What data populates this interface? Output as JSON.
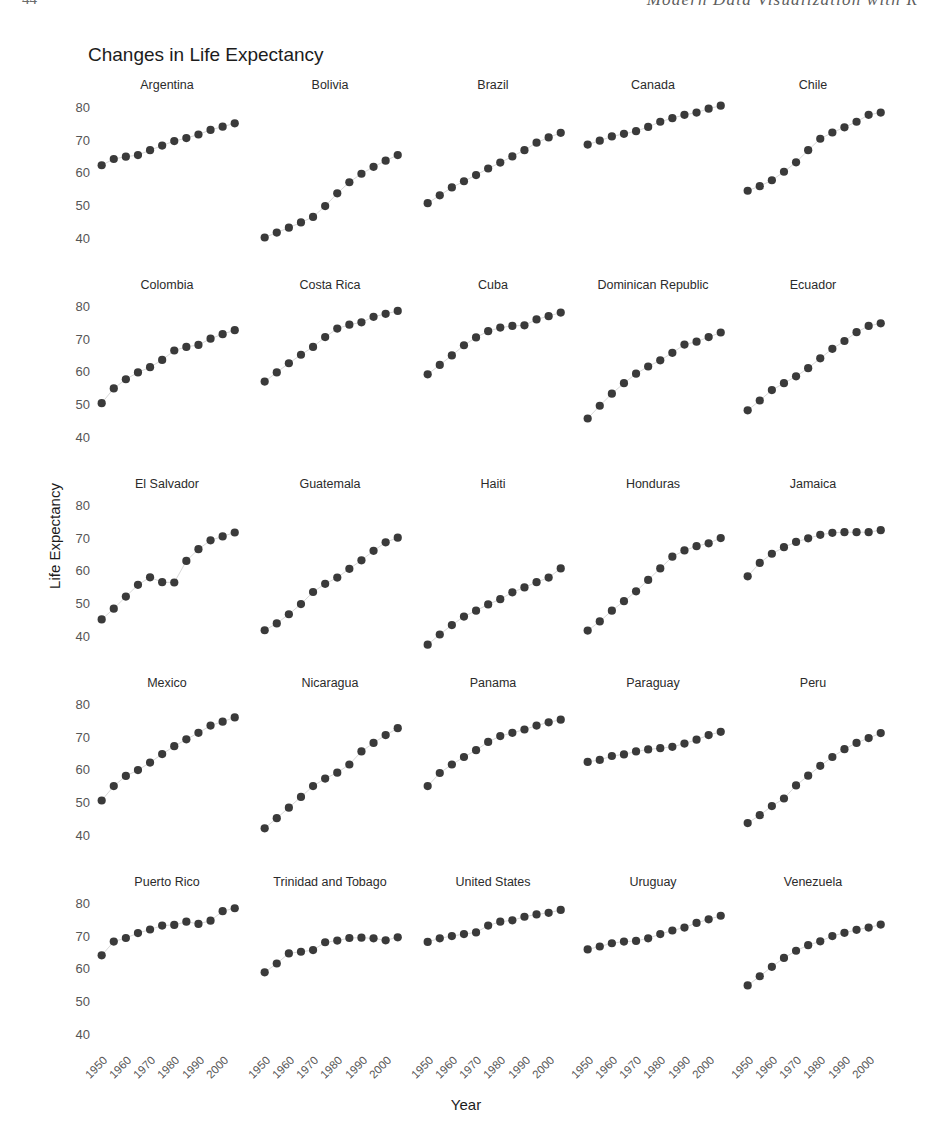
{
  "page_header": {
    "folio": "44",
    "running_title": "Modern Data Visualization with R"
  },
  "figure": {
    "title": "Changes in Life Expectancy",
    "x_axis_title": "Year",
    "y_axis_title": "Life Expectancy"
  },
  "chart_data": {
    "type": "scatter",
    "title": "Changes in Life Expectancy",
    "xlabel": "Year",
    "ylabel": "Life Expectancy",
    "xlim": [
      1948,
      2010
    ],
    "ylim": [
      36,
      84
    ],
    "xticks": [
      "1950",
      "1960",
      "1970",
      "1980",
      "1990",
      "2000"
    ],
    "xtick_values": [
      1950,
      1960,
      1970,
      1980,
      1990,
      2000
    ],
    "yticks": [
      "40",
      "50",
      "60",
      "70",
      "80"
    ],
    "ytick_values": [
      40,
      50,
      60,
      70,
      80
    ],
    "grid": false,
    "legend": "none",
    "facet_rows": 5,
    "facet_cols": 5,
    "x": [
      1952,
      1957,
      1962,
      1967,
      1972,
      1977,
      1982,
      1987,
      1992,
      1997,
      2002,
      2007
    ],
    "panels": [
      {
        "name": "Argentina",
        "values": [
          62.5,
          64.4,
          65.1,
          65.6,
          67.1,
          68.5,
          69.9,
          70.8,
          71.9,
          73.3,
          74.3,
          75.3
        ]
      },
      {
        "name": "Bolivia",
        "values": [
          40.4,
          41.9,
          43.4,
          45.0,
          46.7,
          50.0,
          53.9,
          57.3,
          59.9,
          62.0,
          63.9,
          65.6
        ]
      },
      {
        "name": "Brazil",
        "values": [
          50.9,
          53.3,
          55.7,
          57.6,
          59.5,
          61.5,
          63.3,
          65.2,
          67.1,
          69.4,
          71.0,
          72.4
        ]
      },
      {
        "name": "Canada",
        "values": [
          68.8,
          70.0,
          71.3,
          72.1,
          72.9,
          74.2,
          75.8,
          76.9,
          77.9,
          78.6,
          79.8,
          80.7
        ]
      },
      {
        "name": "Chile",
        "values": [
          54.7,
          56.1,
          57.9,
          60.5,
          63.4,
          67.1,
          70.6,
          72.5,
          74.1,
          75.8,
          77.9,
          78.6
        ]
      },
      {
        "name": "Colombia",
        "values": [
          50.6,
          55.1,
          57.9,
          60.0,
          61.6,
          63.8,
          66.7,
          67.8,
          68.4,
          70.3,
          71.7,
          72.9
        ]
      },
      {
        "name": "Costa Rica",
        "values": [
          57.2,
          60.0,
          62.8,
          65.4,
          67.8,
          70.8,
          73.4,
          74.6,
          75.3,
          77.0,
          77.9,
          78.8
        ]
      },
      {
        "name": "Cuba",
        "values": [
          59.4,
          62.3,
          65.2,
          68.3,
          70.7,
          72.6,
          73.7,
          74.2,
          74.4,
          76.2,
          77.2,
          78.3
        ]
      },
      {
        "name": "Dominican Republic",
        "values": [
          45.9,
          49.8,
          53.5,
          56.7,
          59.6,
          61.8,
          63.7,
          66.0,
          68.5,
          69.4,
          70.8,
          72.2
        ]
      },
      {
        "name": "Ecuador",
        "values": [
          48.4,
          51.4,
          54.6,
          56.7,
          58.8,
          61.3,
          64.3,
          67.2,
          69.6,
          72.3,
          74.2,
          75.0
        ]
      },
      {
        "name": "El Salvador",
        "values": [
          45.3,
          48.6,
          52.3,
          55.9,
          58.2,
          56.7,
          56.6,
          63.2,
          66.8,
          69.5,
          70.7,
          71.9
        ]
      },
      {
        "name": "Guatemala",
        "values": [
          42.0,
          44.1,
          46.9,
          50.0,
          53.7,
          56.2,
          58.1,
          60.8,
          63.4,
          66.3,
          68.9,
          70.3
        ]
      },
      {
        "name": "Haiti",
        "values": [
          37.6,
          40.7,
          43.6,
          46.2,
          48.0,
          49.9,
          51.5,
          53.6,
          55.1,
          56.7,
          58.1,
          60.9
        ]
      },
      {
        "name": "Honduras",
        "values": [
          41.9,
          44.7,
          48.0,
          50.9,
          53.9,
          57.4,
          60.9,
          64.5,
          66.4,
          67.7,
          68.6,
          70.2
        ]
      },
      {
        "name": "Jamaica",
        "values": [
          58.5,
          62.6,
          65.4,
          67.4,
          69.0,
          70.1,
          71.2,
          71.8,
          72.0,
          72.0,
          72.0,
          72.6
        ]
      },
      {
        "name": "Mexico",
        "values": [
          50.8,
          55.2,
          58.3,
          60.1,
          62.4,
          65.0,
          67.4,
          69.5,
          71.5,
          73.7,
          74.9,
          76.2
        ]
      },
      {
        "name": "Nicaragua",
        "values": [
          42.3,
          45.4,
          48.6,
          51.9,
          55.2,
          57.5,
          59.3,
          61.8,
          65.8,
          68.4,
          70.8,
          72.9
        ]
      },
      {
        "name": "Panama",
        "values": [
          55.2,
          59.2,
          61.8,
          64.1,
          66.2,
          68.7,
          70.5,
          71.5,
          72.5,
          73.7,
          74.7,
          75.5
        ]
      },
      {
        "name": "Paraguay",
        "values": [
          62.6,
          63.2,
          64.4,
          64.9,
          65.8,
          66.4,
          66.8,
          67.2,
          68.2,
          69.4,
          70.8,
          71.8
        ]
      },
      {
        "name": "Peru",
        "values": [
          43.9,
          46.3,
          49.1,
          51.4,
          55.4,
          58.4,
          61.4,
          64.1,
          66.5,
          68.4,
          69.9,
          71.4
        ]
      },
      {
        "name": "Puerto Rico",
        "values": [
          64.3,
          68.5,
          69.6,
          71.1,
          72.2,
          73.4,
          73.6,
          74.6,
          73.9,
          74.9,
          77.8,
          78.7
        ]
      },
      {
        "name": "Trinidad and Tobago",
        "values": [
          59.1,
          61.8,
          64.9,
          65.4,
          65.9,
          68.3,
          68.8,
          69.6,
          69.7,
          69.5,
          68.9,
          69.8
        ]
      },
      {
        "name": "United States",
        "values": [
          68.4,
          69.5,
          70.2,
          70.8,
          71.3,
          73.4,
          74.6,
          75.0,
          76.1,
          76.8,
          77.3,
          78.2
        ]
      },
      {
        "name": "Uruguay",
        "values": [
          66.1,
          67.0,
          68.0,
          68.5,
          68.7,
          69.5,
          70.8,
          71.9,
          72.8,
          74.2,
          75.3,
          76.4
        ]
      },
      {
        "name": "Venezuela",
        "values": [
          55.1,
          57.9,
          60.8,
          63.5,
          65.7,
          67.4,
          68.6,
          70.2,
          71.2,
          72.1,
          72.8,
          73.7
        ]
      }
    ]
  }
}
